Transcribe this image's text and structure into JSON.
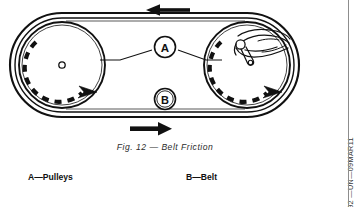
{
  "figure": {
    "caption": "Fig.  12  —  Belt Friction",
    "side_code": "DXP02392 —UN—09MAR11",
    "callouts": [
      {
        "key": "A",
        "label": "A",
        "refers_to": "Pulleys"
      },
      {
        "key": "B",
        "label": "B",
        "refers_to": "Belt"
      }
    ],
    "legend": [
      {
        "key": "A",
        "text": "A—Pulleys"
      },
      {
        "key": "B",
        "text": "B—Belt"
      }
    ],
    "parts": {
      "left_pulley": "left-pulley",
      "right_pulley": "right-pulley",
      "belt": "belt-loop",
      "hand": "hand-gripping-pulley",
      "top_belt_arrow": "belt-direction-left",
      "bottom_belt_arrow": "belt-direction-right",
      "left_rotation_arrow": "pulley-rotation-clockwise",
      "right_rotation_arrow": "pulley-rotation-clockwise"
    },
    "colors": {
      "ink": "#111111",
      "page": "#ffffff",
      "rule": "#8d8d8d",
      "caption_ink": "#2c2c2c"
    }
  }
}
